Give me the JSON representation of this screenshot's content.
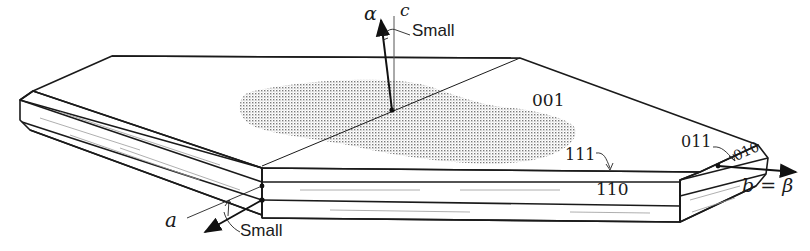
{
  "diagram": {
    "type": "crystal-morphology",
    "faces": {
      "top": "001",
      "edge_upper": "111",
      "edge_side": "110",
      "corner_upper": "011",
      "end": "010"
    },
    "axes": {
      "alpha": "α",
      "c": "c",
      "a": "a",
      "b_beta": "b = β"
    },
    "annotations": {
      "small_top": "Small",
      "small_bottom": "Small"
    },
    "colors": {
      "line": "#1a1a1a",
      "stipple": "#8c8c8c",
      "background": "#ffffff"
    }
  }
}
